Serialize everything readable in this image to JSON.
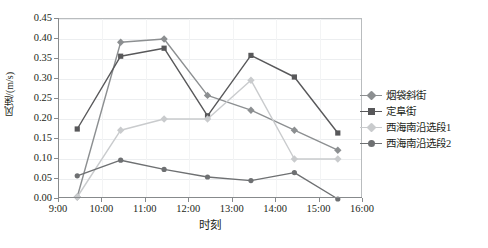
{
  "chart_data": {
    "type": "line",
    "title": "",
    "xlabel": "时刻",
    "ylabel": "风速/(m/s)",
    "xlim": [
      9,
      16
    ],
    "ylim": [
      0.0,
      0.45
    ],
    "grid": true,
    "legend_position": "right",
    "x_tick_labels": [
      "9:00",
      "10:00",
      "11:00",
      "12:00",
      "13:00",
      "14:00",
      "15:00",
      "16:00"
    ],
    "x_tick_values": [
      9,
      10,
      11,
      12,
      13,
      14,
      15,
      16
    ],
    "y_tick_labels": [
      "0.00",
      "0.05",
      "0.10",
      "0.15",
      "0.20",
      "0.25",
      "0.30",
      "0.35",
      "0.40",
      "0.45"
    ],
    "y_tick_values": [
      0.0,
      0.05,
      0.1,
      0.15,
      0.2,
      0.25,
      0.3,
      0.35,
      0.4,
      0.45
    ],
    "x": [
      9.42,
      10.42,
      11.42,
      12.42,
      13.42,
      14.42,
      15.42
    ],
    "series": [
      {
        "name": "烟袋斜街",
        "marker": "diamond",
        "color": "#8c8f91",
        "values": [
          0.005,
          0.392,
          0.4,
          0.259,
          0.222,
          0.172,
          0.122
        ]
      },
      {
        "name": "定阜街",
        "marker": "square",
        "color": "#58585a",
        "values": [
          0.175,
          0.357,
          0.377,
          0.208,
          0.359,
          0.305,
          0.165
        ]
      },
      {
        "name": "西海南沿选段1",
        "marker": "diamond",
        "color": "#c9cbcd",
        "values": [
          0.005,
          0.172,
          0.2,
          0.2,
          0.297,
          0.1,
          0.1
        ]
      },
      {
        "name": "西海南沿选段2",
        "marker": "circle",
        "color": "#6e7072",
        "values": [
          0.058,
          0.097,
          0.074,
          0.055,
          0.046,
          0.066,
          0.0
        ]
      }
    ]
  }
}
